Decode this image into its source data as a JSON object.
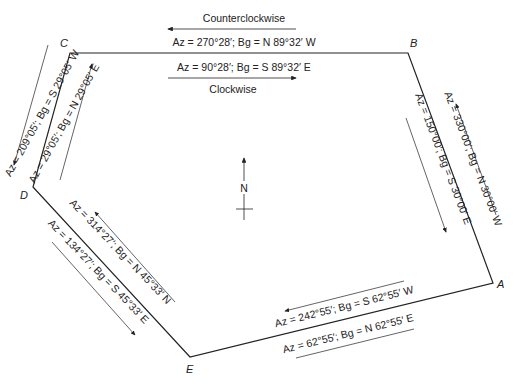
{
  "diagram": {
    "directions": {
      "counterclockwise": "Counterclockwise",
      "clockwise": "Clockwise"
    },
    "north_label": "N",
    "points": {
      "A": "A",
      "B": "B",
      "C": "C",
      "D": "D",
      "E": "E"
    },
    "courses": {
      "BC": "Az = 270°28′; Bg = N 89°32′ W",
      "CB": "Az = 90°28′; Bg = S 89°32′ E",
      "CD": "Az = 209°05′; Bg = S 29°05′ W",
      "DC": "Az = 29°05′; Bg = N 29°05′ E",
      "AB": "Az = 330°00′; Bg = N 30°00′ W",
      "BA": "Az = 150°00′; Bg = S 30°00′ E",
      "ED": "Az = 314°27′; Bg = N 45°33′ N",
      "DE": "Az = 134°27′; Bg = S 45°33′ E",
      "AE": "Az = 242°55′; Bg = S 62°55′ W",
      "EA": "Az = 62°55′; Bg = N 62°55′ E"
    },
    "line_color": "#222222"
  }
}
